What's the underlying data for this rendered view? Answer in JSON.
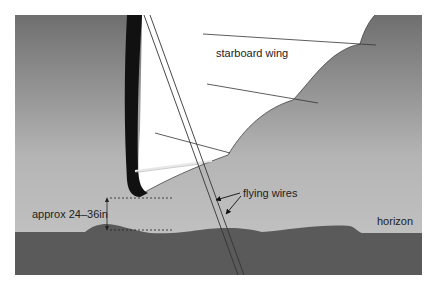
{
  "diagram": {
    "labels": {
      "wing": "starboard wing",
      "wires": "flying wires",
      "height": "approx 24–36in",
      "horizon": "horizon"
    },
    "colors": {
      "sky_top": "#727272",
      "sky_bottom": "#c4c4c4",
      "ground": "#5a5a5a",
      "wing_fill": "#ffffff",
      "wingtip_edge": "#111111",
      "lines": "#333333"
    }
  }
}
